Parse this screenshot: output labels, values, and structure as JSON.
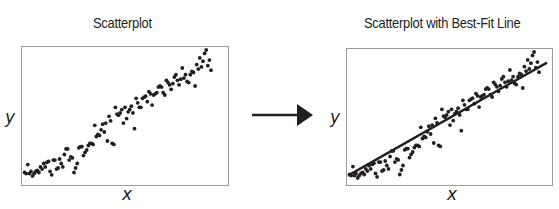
{
  "left_panel": {
    "title": "Scatterplot",
    "xlabel": "x",
    "ylabel": "y"
  },
  "right_panel": {
    "title": "Scatterplot with Best-Fit Line",
    "xlabel": "x",
    "ylabel": "y"
  },
  "arrow": {
    "direction": "right",
    "color": "#231f20"
  },
  "colors": {
    "points": "#231f20",
    "frame": "#9a9a9a",
    "line": "#231f20"
  },
  "chart_data": [
    {
      "type": "scatter",
      "title": "Scatterplot",
      "xlabel": "x",
      "ylabel": "y",
      "grid": false,
      "note": "Positive linear relationship; approx. 115 points; no tick labels",
      "points": [
        [
          1,
          4
        ],
        [
          2,
          3
        ],
        [
          3,
          11
        ],
        [
          4,
          3
        ],
        [
          5,
          5
        ],
        [
          6,
          1
        ],
        [
          7,
          3
        ],
        [
          8,
          5
        ],
        [
          9,
          6
        ],
        [
          10,
          4
        ],
        [
          11,
          9
        ],
        [
          12,
          7
        ],
        [
          13,
          12
        ],
        [
          14,
          9
        ],
        [
          15,
          13
        ],
        [
          16,
          14
        ],
        [
          17,
          5
        ],
        [
          18,
          2
        ],
        [
          19,
          15
        ],
        [
          20,
          15
        ],
        [
          21,
          7
        ],
        [
          22,
          8
        ],
        [
          23,
          16
        ],
        [
          24,
          12
        ],
        [
          25,
          9
        ],
        [
          26,
          20
        ],
        [
          27,
          25
        ],
        [
          28,
          25
        ],
        [
          29,
          15
        ],
        [
          30,
          18
        ],
        [
          31,
          17
        ],
        [
          32,
          4
        ],
        [
          33,
          8
        ],
        [
          34,
          12
        ],
        [
          35,
          26
        ],
        [
          36,
          27
        ],
        [
          37,
          27
        ],
        [
          38,
          19
        ],
        [
          39,
          22
        ],
        [
          40,
          24
        ],
        [
          41,
          28
        ],
        [
          42,
          30
        ],
        [
          43,
          30
        ],
        [
          44,
          29
        ],
        [
          45,
          46
        ],
        [
          46,
          36
        ],
        [
          47,
          38
        ],
        [
          48,
          37
        ],
        [
          49,
          42
        ],
        [
          50,
          47
        ],
        [
          51,
          40
        ],
        [
          52,
          48
        ],
        [
          53,
          32
        ],
        [
          54,
          54
        ],
        [
          55,
          50
        ],
        [
          56,
          30
        ],
        [
          57,
          29
        ],
        [
          58,
          62
        ],
        [
          59,
          56
        ],
        [
          60,
          55
        ],
        [
          61,
          57
        ],
        [
          62,
          60
        ],
        [
          63,
          48
        ],
        [
          64,
          62
        ],
        [
          65,
          52
        ],
        [
          66,
          58
        ],
        [
          67,
          60
        ],
        [
          68,
          63
        ],
        [
          69,
          57
        ],
        [
          70,
          43
        ],
        [
          71,
          70
        ],
        [
          72,
          66
        ],
        [
          73,
          62
        ],
        [
          74,
          62
        ],
        [
          75,
          70
        ],
        [
          76,
          71
        ],
        [
          77,
          72
        ],
        [
          78,
          67
        ],
        [
          79,
          76
        ],
        [
          80,
          74
        ],
        [
          81,
          64
        ],
        [
          82,
          73
        ],
        [
          83,
          74
        ],
        [
          84,
          75
        ],
        [
          85,
          80
        ],
        [
          86,
          81
        ],
        [
          87,
          80
        ],
        [
          88,
          75
        ],
        [
          89,
          73
        ],
        [
          90,
          86
        ],
        [
          91,
          84
        ],
        [
          92,
          82
        ],
        [
          93,
          78
        ],
        [
          94,
          83
        ],
        [
          95,
          89
        ],
        [
          96,
          91
        ],
        [
          97,
          86
        ],
        [
          98,
          82
        ],
        [
          99,
          87
        ],
        [
          100,
          97
        ],
        [
          101,
          88
        ],
        [
          102,
          91
        ],
        [
          103,
          85
        ],
        [
          104,
          84
        ],
        [
          105,
          91
        ],
        [
          106,
          94
        ],
        [
          107,
          93
        ],
        [
          108,
          81
        ],
        [
          109,
          100
        ],
        [
          110,
          96
        ],
        [
          111,
          106
        ],
        [
          112,
          98
        ],
        [
          113,
          103
        ],
        [
          114,
          110
        ],
        [
          115,
          113
        ],
        [
          116,
          99
        ],
        [
          117,
          104
        ],
        [
          118,
          95
        ]
      ]
    },
    {
      "type": "scatter",
      "title": "Scatterplot with Best-Fit Line",
      "xlabel": "x",
      "ylabel": "y",
      "grid": false,
      "note": "Same data with linear least-squares best-fit line",
      "best_fit_line": {
        "x": [
          0,
          118
        ],
        "y": [
          3,
          100
        ]
      }
    }
  ]
}
